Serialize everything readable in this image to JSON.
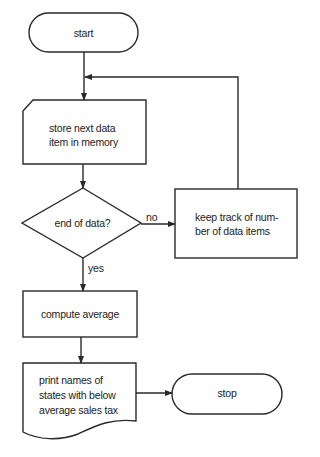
{
  "diagram": {
    "type": "flowchart",
    "nodes": {
      "start": {
        "shape": "terminal",
        "label": "start"
      },
      "store": {
        "shape": "manual-input",
        "label_line1": "store next data",
        "label_line2": "item in memory"
      },
      "decision": {
        "shape": "decision",
        "label": "end of data?"
      },
      "keep_track": {
        "shape": "process",
        "label_line1": "keep track of num-",
        "label_line2": "ber of data items"
      },
      "compute": {
        "shape": "process",
        "label": "compute average"
      },
      "print": {
        "shape": "document",
        "label_line1": "print names of",
        "label_line2": "states with below",
        "label_line3": "average sales tax"
      },
      "stop": {
        "shape": "terminal",
        "label": "stop"
      }
    },
    "edges": {
      "no_label": "no",
      "yes_label": "yes"
    },
    "colors": {
      "stroke": "#2a2a2a",
      "background": "#ffffff"
    }
  }
}
